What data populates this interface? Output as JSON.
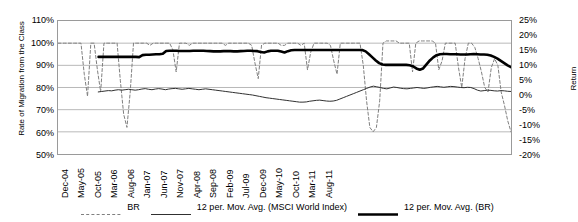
{
  "chart_data": {
    "type": "line",
    "title": "",
    "xlabel": "",
    "ylabel": "Rate of Migration from the Class",
    "ylabel_secondary": "Return",
    "ylim": [
      50,
      110
    ],
    "ytick_labels": [
      "110%",
      "100%",
      "90%",
      "80%",
      "70%",
      "60%",
      "50%"
    ],
    "ylim_secondary": [
      -20,
      25
    ],
    "ytick_labels_secondary": [
      "25%",
      "20%",
      "15%",
      "10%",
      "5%",
      "0%",
      "-5%",
      "-10%",
      "-15%",
      "-20%"
    ],
    "grid": true,
    "legend_position": "bottom",
    "x_tick_labels": [
      "Dec-04",
      "May-05",
      "Oct-05",
      "Mar-06",
      "Aug-06",
      "Jan-07",
      "Jun-07",
      "Nov-07",
      "Apr-08",
      "Sep-08",
      "Feb-09",
      "Jul-09",
      "Dec-09",
      "May-10",
      "Oct-10",
      "Mar-11",
      "Aug-11"
    ],
    "x_tick_interval_months": 5,
    "x_start": "Dec-04",
    "x_end": "Dec-11",
    "series": [
      {
        "name": "BR",
        "style": "dashed",
        "axis": "left",
        "color": "#808080",
        "values": [
          100,
          100,
          100,
          100,
          100,
          100,
          100,
          100,
          86,
          76,
          100,
          100,
          88,
          78,
          100,
          100,
          100,
          100,
          100,
          83,
          68,
          62,
          78,
          100,
          100,
          100,
          100,
          100,
          99,
          100,
          100,
          100,
          100,
          100,
          100,
          97,
          87,
          100,
          100,
          100,
          99,
          100,
          100,
          100,
          100,
          100,
          100,
          100,
          100,
          100,
          100,
          99,
          100,
          100,
          100,
          100,
          100,
          100,
          100,
          99,
          91,
          84,
          99,
          100,
          100,
          100,
          100,
          100,
          99,
          99,
          100,
          100,
          100,
          100,
          99,
          100,
          88,
          96,
          100,
          100,
          100,
          100,
          100,
          99,
          92,
          86,
          100,
          100,
          100,
          100,
          100,
          100,
          100,
          90,
          74,
          62,
          60,
          62,
          74,
          100,
          101,
          101,
          101,
          101,
          100,
          100,
          100,
          100,
          87,
          100,
          101,
          101,
          101,
          101,
          101,
          100,
          88,
          92,
          100,
          100,
          100,
          100,
          89,
          80,
          93,
          100,
          100,
          98,
          93,
          87,
          80,
          78,
          89,
          93,
          90,
          78,
          72,
          65,
          60
        ]
      },
      {
        "name": "12 per. Mov. Avg. (MSCI World Index)",
        "style": "solid-thin",
        "axis": "left",
        "color": "#303030",
        "values": [
          null,
          null,
          null,
          null,
          null,
          null,
          null,
          null,
          null,
          null,
          null,
          null,
          78,
          78.2,
          78.4,
          78.6,
          78.5,
          78.8,
          79,
          78.8,
          79,
          79.2,
          79,
          78.8,
          79,
          79.3,
          79.5,
          79.2,
          79,
          79.3,
          79.5,
          79.3,
          79,
          79.3,
          79.5,
          79.6,
          79.4,
          79.2,
          79.4,
          79.6,
          79.4,
          79.2,
          79,
          79.2,
          79.4,
          79.2,
          79,
          78.8,
          78.6,
          78.4,
          78.2,
          78,
          77.8,
          77.6,
          77.4,
          77.2,
          77,
          76.8,
          76.6,
          76.3,
          76,
          75.7,
          75.4,
          75.2,
          75,
          74.8,
          74.6,
          74.4,
          74.2,
          74,
          73.8,
          73.6,
          73.4,
          73.4,
          73.5,
          73.8,
          74,
          74.2,
          74.3,
          74.1,
          73.9,
          73.8,
          73.9,
          74.2,
          74.8,
          75.4,
          76,
          76.6,
          77.2,
          77.8,
          78.4,
          79,
          79.6,
          80.2,
          80.6,
          80.3,
          80,
          79.6,
          79.4,
          79.8,
          80.2,
          80,
          79.7,
          79.5,
          79.4,
          79.6,
          79.8,
          80,
          79.8,
          79.6,
          79.8,
          80.1,
          80.3,
          80.5,
          80.3,
          80.1,
          80.3,
          80.5,
          80.4,
          80.2,
          80,
          79.9,
          80.1,
          80,
          79.5,
          78.8,
          78.4,
          78.6,
          78.8,
          78.7,
          78.5,
          78.4,
          78.6,
          78.5,
          78.3,
          78.2
        ]
      },
      {
        "name": "12 per. Mov. Avg. (BR)",
        "style": "solid-thick",
        "axis": "left",
        "color": "#000000",
        "values": [
          null,
          null,
          null,
          null,
          null,
          null,
          null,
          null,
          null,
          null,
          null,
          null,
          93.8,
          93.8,
          93.8,
          93.8,
          93.8,
          93.8,
          93.8,
          93.8,
          93.8,
          93.8,
          93.8,
          93.8,
          93.7,
          94.6,
          94.8,
          94.8,
          94.9,
          95,
          95,
          95.2,
          96.5,
          96.6,
          96.6,
          96.6,
          96.5,
          96.5,
          96.5,
          96.5,
          96.6,
          96.6,
          96.6,
          96.6,
          96.5,
          96.4,
          96.3,
          96.3,
          96.3,
          96.4,
          96.4,
          96.4,
          96.3,
          96.3,
          96.4,
          96.5,
          96.6,
          96.6,
          96.5,
          96.4,
          96,
          95.8,
          96.3,
          96.6,
          96.6,
          96.6,
          96.2,
          95.8,
          96.4,
          96.8,
          96.9,
          96.9,
          96.9,
          96.9,
          96.9,
          96.9,
          96.9,
          96.9,
          96.9,
          96.9,
          96.9,
          96.9,
          96.9,
          96.9,
          96.9,
          96.9,
          96.9,
          96.9,
          96.9,
          96.9,
          96.9,
          96.3,
          95,
          93.6,
          92.2,
          91,
          90.4,
          90.2,
          90.2,
          90.2,
          90.2,
          90.2,
          90.2,
          90.2,
          90,
          89.6,
          88.6,
          88,
          88.6,
          90.4,
          92.2,
          93.6,
          94.6,
          95,
          95.1,
          95.1,
          95,
          95,
          95,
          94.9,
          94.9,
          94.9,
          95,
          95.1,
          95,
          94.9,
          94.9,
          94.8,
          94.4,
          93.8,
          93,
          92,
          91,
          90,
          89.2
        ]
      }
    ]
  },
  "legend": {
    "items": [
      {
        "label": "BR",
        "style": "dashed"
      },
      {
        "label": "12 per. Mov. Avg. (MSCI World Index)",
        "style": "solid-thin"
      },
      {
        "label": "12 per. Mov. Avg. (BR)",
        "style": "solid-thick"
      }
    ]
  }
}
